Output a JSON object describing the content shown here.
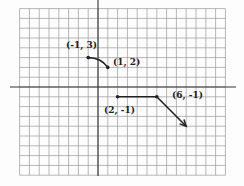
{
  "chart_data": {
    "type": "line",
    "title": "",
    "xlabel": "",
    "ylabel": "",
    "grid": true,
    "xlim": [
      -8,
      13
    ],
    "ylim": [
      -9,
      8
    ],
    "segments": [
      {
        "kind": "curve",
        "from": [
          -1,
          3
        ],
        "to": [
          1,
          2
        ],
        "endpoints": "closed"
      },
      {
        "kind": "line",
        "from": [
          2,
          -1
        ],
        "to": [
          6,
          -1
        ],
        "endpoints": "closed"
      },
      {
        "kind": "ray",
        "from": [
          6,
          -1
        ],
        "to": [
          9,
          -4
        ],
        "endpoints": "arrow"
      }
    ],
    "annotations": [
      {
        "text": "(-1, 3)",
        "x": -1,
        "y": 3
      },
      {
        "text": "(1, 2)",
        "x": 1,
        "y": 2
      },
      {
        "text": "(2, -1)",
        "x": 2,
        "y": -1
      },
      {
        "text": "(6, -1)",
        "x": 6,
        "y": -1
      }
    ]
  },
  "labels": {
    "p1": "(-1, 3)",
    "p2": "(1, 2)",
    "p3": "(2, -1)",
    "p4": "(6, -1)"
  },
  "colors": {
    "grid": "#9a9a9a",
    "axis": "#333333",
    "curve": "#222222"
  }
}
